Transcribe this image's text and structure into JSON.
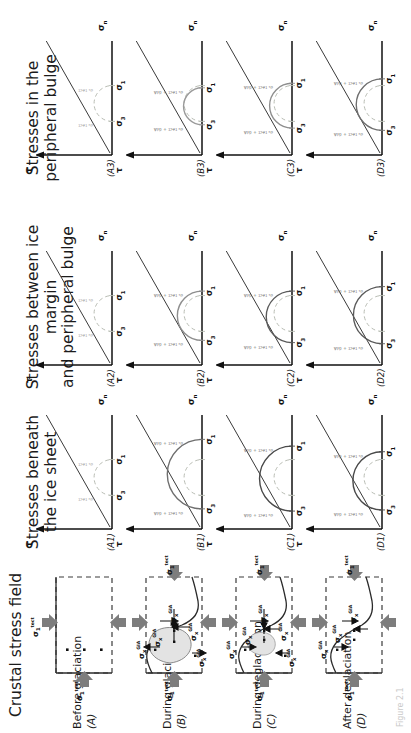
{
  "figure": {
    "caption": "Figure 2.1",
    "columns": [
      {
        "id": "col-crustal",
        "title": "Crustal stress field"
      },
      {
        "id": "col-beneath",
        "title": "Stresses beneath\nthe ice sheet"
      },
      {
        "id": "col-between",
        "title": "Stresses between ice margin\nand peripheral bulge"
      },
      {
        "id": "col-bulge",
        "title": "Stresses in the\nperipheral bulge"
      }
    ],
    "rows": [
      {
        "key": "A",
        "stage": "Before glaciation",
        "letter": "(A)",
        "panels": [
          "(A1)",
          "(A2)",
          "(A3)"
        ]
      },
      {
        "key": "B",
        "stage": "During glaciation",
        "letter": "(B)",
        "panels": [
          "(B1)",
          "(B2)",
          "(B3)"
        ]
      },
      {
        "key": "C",
        "stage": "During deglaciation",
        "letter": "(C)",
        "panels": [
          "(C1)",
          "(C2)",
          "(C3)"
        ]
      },
      {
        "key": "D",
        "stage": "After deglaciation",
        "letter": "(D)",
        "panels": [
          "(D1)",
          "(D2)",
          "(D3)"
        ]
      }
    ],
    "axes": {
      "shear": "τ",
      "normal_base": "σ",
      "normal_sub": "n"
    },
    "stress_symbols": {
      "sigma1_tect": "σ₁ tect",
      "sigma3_tect": "σ₃ tect",
      "sigma_x_gia": "σx GIA",
      "sigma_z_gia": "σz GIA",
      "sigma1_label": "σ₁",
      "sigma3_label": "σ₃",
      "sigma1_plus_gia": "σ₁ tect + GIA",
      "sigma3_plus_gia": "σ₃ tect + GIA",
      "sigma1_tect_small": "σ₁ tect",
      "sigma3_tect_small": "σ₃ tect"
    },
    "colors": {
      "ink": "#1b1b1b",
      "grey_arrow": "#7d7d7d",
      "dashed_circle": "#b9bdb4",
      "solid_circle": "#8e8e8e",
      "dark_circle": "#4a4a4a",
      "envelope": "#3a3a3a",
      "ice_fill": "#e3e3e3"
    }
  },
  "chart_data": {
    "type": "line",
    "xlabel": "σn",
    "ylabel": "τ",
    "grid": false,
    "legend": "none",
    "panels": [
      {
        "id": "A1",
        "row": "Before glaciation",
        "column": "Stresses beneath the ice sheet",
        "circles": [
          {
            "name": "tectonic (dashed)",
            "sigma3": 0.3,
            "sigma1": 0.62,
            "style": "dashed",
            "color": "#b9bdb4"
          }
        ],
        "envelope": {
          "cohesion": 0.0,
          "slope": -1.0
        },
        "tick_labels": [
          "σ₃",
          "σ₁"
        ],
        "annotations": [
          "σ₃ tect",
          "σ₁ tect"
        ]
      },
      {
        "id": "A2",
        "row": "Before glaciation",
        "column": "Stresses between ice margin and peripheral bulge",
        "circles": [
          {
            "name": "tectonic (dashed)",
            "sigma3": 0.3,
            "sigma1": 0.62,
            "style": "dashed",
            "color": "#b9bdb4"
          }
        ],
        "envelope": {
          "cohesion": 0.0,
          "slope": -1.0
        },
        "tick_labels": [
          "σ₃",
          "σ₁"
        ],
        "annotations": [
          "σ₃ tect",
          "σ₁ tect"
        ]
      },
      {
        "id": "A3",
        "row": "Before glaciation",
        "column": "Stresses in the peripheral bulge",
        "circles": [
          {
            "name": "tectonic (dashed)",
            "sigma3": 0.3,
            "sigma1": 0.62,
            "style": "dashed",
            "color": "#b9bdb4"
          }
        ],
        "envelope": {
          "cohesion": 0.0,
          "slope": -1.0
        },
        "tick_labels": [
          "σ₃",
          "σ₁"
        ],
        "annotations": [
          "σ₃ tect",
          "σ₁ tect"
        ]
      },
      {
        "id": "B1",
        "row": "During glaciation",
        "column": "Stresses beneath the ice sheet",
        "circles": [
          {
            "name": "tectonic (dashed)",
            "sigma3": 0.3,
            "sigma1": 0.62,
            "style": "dashed",
            "color": "#b9bdb4"
          },
          {
            "name": "tectonic + GIA",
            "sigma3": 0.18,
            "sigma1": 0.8,
            "style": "solid",
            "color": "#6f6f6f"
          }
        ],
        "envelope": {
          "cohesion": 0.0,
          "slope": -1.0
        },
        "tick_labels": [
          "σ₃",
          "σ₁"
        ],
        "annotations": [
          "σ₃ tect + GIA",
          "σ₁ tect + GIA"
        ]
      },
      {
        "id": "B2",
        "row": "During glaciation",
        "column": "Stresses between ice margin and peripheral bulge",
        "circles": [
          {
            "name": "tectonic (dashed)",
            "sigma3": 0.3,
            "sigma1": 0.62,
            "style": "dashed",
            "color": "#b9bdb4"
          },
          {
            "name": "tectonic + GIA",
            "sigma3": 0.22,
            "sigma1": 0.66,
            "style": "solid",
            "color": "#8e8e8e"
          }
        ],
        "envelope": {
          "cohesion": 0.0,
          "slope": -1.0
        },
        "tick_labels": [
          "σ₃",
          "σ₁"
        ],
        "annotations": [
          "σ₃ tect + GIA",
          "σ₁ tect + GIA"
        ]
      },
      {
        "id": "B3",
        "row": "During glaciation",
        "column": "Stresses in the peripheral bulge",
        "circles": [
          {
            "name": "tectonic (dashed)",
            "sigma3": 0.3,
            "sigma1": 0.62,
            "style": "dashed",
            "color": "#b9bdb4"
          },
          {
            "name": "tectonic + GIA",
            "sigma3": 0.27,
            "sigma1": 0.6,
            "style": "solid",
            "color": "#9a9a9a"
          }
        ],
        "envelope": {
          "cohesion": 0.0,
          "slope": -1.0
        },
        "tick_labels": [
          "σ₃",
          "σ₁"
        ],
        "annotations": [
          "σ₃ tect + GIA",
          "σ₁ tect + GIA"
        ]
      },
      {
        "id": "C1",
        "row": "During deglaciation",
        "column": "Stresses beneath the ice sheet",
        "circles": [
          {
            "name": "tectonic (dashed)",
            "sigma3": 0.3,
            "sigma1": 0.62,
            "style": "dashed",
            "color": "#b9bdb4"
          },
          {
            "name": "tectonic + GIA",
            "sigma3": 0.16,
            "sigma1": 0.74,
            "style": "solid",
            "color": "#4a4a4a"
          }
        ],
        "envelope": {
          "cohesion": 0.0,
          "slope": -1.0
        },
        "tick_labels": [
          "σ₃",
          "σ₁"
        ],
        "annotations": [
          "σ₃ tect + GIA",
          "σ₁ tect + GIA"
        ]
      },
      {
        "id": "C2",
        "row": "During deglaciation",
        "column": "Stresses between ice margin and peripheral bulge",
        "circles": [
          {
            "name": "tectonic (dashed)",
            "sigma3": 0.3,
            "sigma1": 0.62,
            "style": "dashed",
            "color": "#b9bdb4"
          },
          {
            "name": "tectonic + GIA",
            "sigma3": 0.2,
            "sigma1": 0.66,
            "style": "solid",
            "color": "#5a5a5a"
          }
        ],
        "envelope": {
          "cohesion": 0.0,
          "slope": -1.0
        },
        "tick_labels": [
          "σ₃",
          "σ₁"
        ],
        "annotations": [
          "σ₃ tect + GIA",
          "σ₁ tect + GIA"
        ]
      },
      {
        "id": "C3",
        "row": "During deglaciation",
        "column": "Stresses in the peripheral bulge",
        "circles": [
          {
            "name": "tectonic (dashed)",
            "sigma3": 0.3,
            "sigma1": 0.62,
            "style": "dashed",
            "color": "#b9bdb4"
          },
          {
            "name": "tectonic + GIA",
            "sigma3": 0.24,
            "sigma1": 0.64,
            "style": "solid",
            "color": "#8e8e8e"
          }
        ],
        "envelope": {
          "cohesion": 0.0,
          "slope": -1.0
        },
        "tick_labels": [
          "σ₃",
          "σ₁"
        ],
        "annotations": [
          "σ₃ tect + GIA",
          "σ₁ tect + GIA"
        ]
      },
      {
        "id": "D1",
        "row": "After deglaciation",
        "column": "Stresses beneath the ice sheet",
        "circles": [
          {
            "name": "tectonic (dashed)",
            "sigma3": 0.3,
            "sigma1": 0.62,
            "style": "dashed",
            "color": "#b9bdb4"
          },
          {
            "name": "tectonic + GIA",
            "sigma3": 0.17,
            "sigma1": 0.69,
            "style": "solid",
            "color": "#4a4a4a"
          }
        ],
        "envelope": {
          "cohesion": 0.0,
          "slope": -1.0
        },
        "tick_labels": [
          "σ₃",
          "σ₁"
        ],
        "annotations": [
          "σ₃ tect + GIA",
          "σ₁ tect + GIA"
        ]
      },
      {
        "id": "D2",
        "row": "After deglaciation",
        "column": "Stresses between ice margin and peripheral bulge",
        "circles": [
          {
            "name": "tectonic (dashed)",
            "sigma3": 0.3,
            "sigma1": 0.62,
            "style": "dashed",
            "color": "#b9bdb4"
          },
          {
            "name": "tectonic + GIA",
            "sigma3": 0.19,
            "sigma1": 0.7,
            "style": "solid",
            "color": "#5a5a5a"
          }
        ],
        "envelope": {
          "cohesion": 0.0,
          "slope": -1.0
        },
        "tick_labels": [
          "σ₃",
          "σ₁"
        ],
        "annotations": [
          "σ₃ tect + GIA",
          "σ₁ tect + GIA"
        ]
      },
      {
        "id": "D3",
        "row": "After deglaciation",
        "column": "Stresses in the peripheral bulge",
        "circles": [
          {
            "name": "tectonic (dashed)",
            "sigma3": 0.3,
            "sigma1": 0.62,
            "style": "dashed",
            "color": "#b9bdb4"
          },
          {
            "name": "tectonic + GIA",
            "sigma3": 0.22,
            "sigma1": 0.68,
            "style": "solid",
            "color": "#6f6f6f"
          }
        ],
        "envelope": {
          "cohesion": 0.0,
          "slope": -1.0
        },
        "tick_labels": [
          "σ₃",
          "σ₁"
        ],
        "annotations": [
          "σ₃ tect + GIA",
          "σ₁ tect + GIA"
        ]
      }
    ]
  }
}
